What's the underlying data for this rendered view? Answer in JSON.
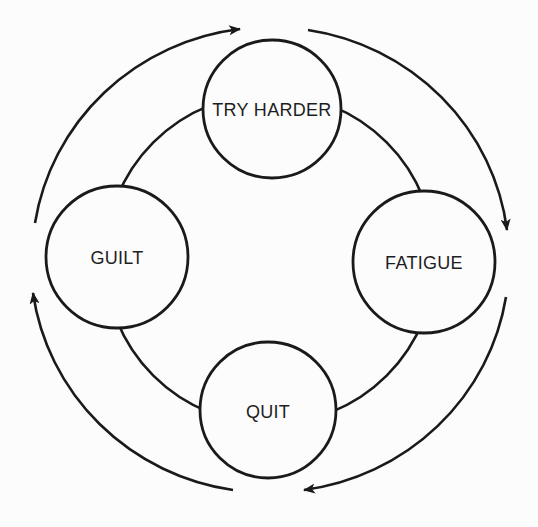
{
  "diagram": {
    "type": "cycle",
    "colors": {
      "background": "#fcfcfc",
      "stroke": "#1a1a1a",
      "text": "#1e1e1e"
    },
    "nodes": [
      {
        "id": "try-harder",
        "label": "TRY HARDER",
        "cx": 272,
        "cy": 109,
        "r": 69
      },
      {
        "id": "fatigue",
        "label": "FATIGUE",
        "cx": 424,
        "cy": 262,
        "r": 71
      },
      {
        "id": "quit",
        "label": "QUIT",
        "cx": 268,
        "cy": 410,
        "r": 68
      },
      {
        "id": "guilt",
        "label": "GUILT",
        "cx": 117,
        "cy": 257,
        "r": 71
      }
    ],
    "flow": [
      {
        "from": "TRY HARDER",
        "to": "FATIGUE",
        "direction": "clockwise"
      },
      {
        "from": "FATIGUE",
        "to": "QUIT",
        "direction": "clockwise"
      },
      {
        "from": "QUIT",
        "to": "GUILT",
        "direction": "clockwise"
      },
      {
        "from": "GUILT",
        "to": "TRY HARDER",
        "direction": "clockwise"
      }
    ]
  }
}
